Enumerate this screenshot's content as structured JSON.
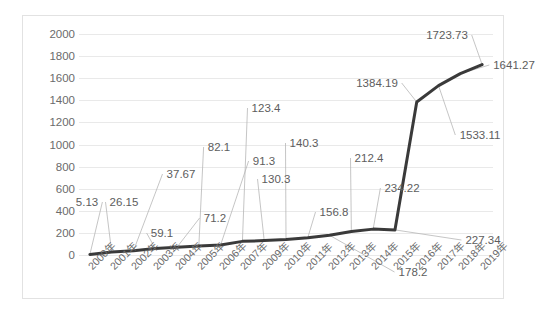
{
  "chart_data": {
    "type": "line",
    "title": "",
    "xlabel": "",
    "ylabel": "",
    "ylim": [
      0,
      2000
    ],
    "ytick_step": 200,
    "grid": true,
    "legend": "none",
    "line_color": "#3a3a3a",
    "label_color": "#5d5d5d",
    "gridline_color": "#e9e9e9",
    "categories": [
      "2000年",
      "2001年",
      "2002年",
      "2003年",
      "2004年",
      "2005年",
      "2006年",
      "2007年",
      "2009年",
      "2010年",
      "2011年",
      "2012年",
      "2013年",
      "2014年",
      "2015年",
      "2016年",
      "2017年",
      "2018年",
      "2019年"
    ],
    "values": [
      5.13,
      26.15,
      37.67,
      59.1,
      71.2,
      82.1,
      91.3,
      123.4,
      130.3,
      140.3,
      156.8,
      178.2,
      212.4,
      234.22,
      227.34,
      1384.19,
      1533.11,
      1641.27,
      1723.73
    ],
    "yticks": [
      "0",
      "200",
      "400",
      "600",
      "800",
      "1000",
      "1200",
      "1400",
      "1600",
      "1800",
      "2000"
    ],
    "data_labels": [
      {
        "text": "5.13",
        "lx": 64,
        "ly": 186
      },
      {
        "text": "26.15",
        "lx": 101,
        "ly": 186
      },
      {
        "text": "37.67",
        "lx": 158,
        "ly": 158
      },
      {
        "text": "59.1",
        "lx": 139,
        "ly": 217
      },
      {
        "text": "71.2",
        "lx": 192,
        "ly": 202
      },
      {
        "text": "82.1",
        "lx": 196,
        "ly": 131
      },
      {
        "text": "91.3",
        "lx": 241,
        "ly": 145
      },
      {
        "text": "123.4",
        "lx": 243,
        "ly": 92
      },
      {
        "text": "130.3",
        "lx": 253,
        "ly": 163
      },
      {
        "text": "140.3",
        "lx": 281,
        "ly": 127
      },
      {
        "text": "156.8",
        "lx": 311,
        "ly": 196
      },
      {
        "text": "178.2",
        "lx": 390,
        "ly": 256
      },
      {
        "text": "212.4",
        "lx": 346,
        "ly": 142
      },
      {
        "text": "234.22",
        "lx": 379,
        "ly": 172
      },
      {
        "text": "227.34",
        "lx": 460,
        "ly": 224
      },
      {
        "text": "1384.19",
        "lx": 354,
        "ly": 67
      },
      {
        "text": "1533.11",
        "lx": 457,
        "ly": 119
      },
      {
        "text": "1641.27",
        "lx": 491,
        "ly": 49
      },
      {
        "text": "1723.73",
        "lx": 424,
        "ly": 19
      }
    ]
  }
}
